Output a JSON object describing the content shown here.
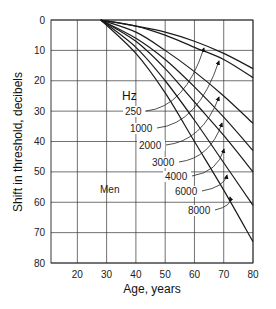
{
  "chart_data": {
    "type": "line",
    "title": "",
    "xlabel": "Age, years",
    "ylabel": "Shift in threshold, decibels",
    "xlim": [
      11,
      80
    ],
    "ylim": [
      0,
      80
    ],
    "y_inverted": true,
    "grid": true,
    "x_ticks": [
      20,
      30,
      40,
      50,
      60,
      70,
      80
    ],
    "y_ticks": [
      0,
      10,
      20,
      30,
      40,
      50,
      60,
      70,
      80
    ],
    "legend_title": "Hz",
    "annotation": "Men",
    "series": [
      {
        "name": "250",
        "x": [
          28,
          40,
          50,
          60,
          70,
          80
        ],
        "y": [
          0,
          2,
          4,
          7,
          11,
          16
        ]
      },
      {
        "name": "1000",
        "x": [
          28,
          40,
          50,
          60,
          70,
          80
        ],
        "y": [
          0,
          2,
          5,
          9,
          13,
          19
        ]
      },
      {
        "name": "2000",
        "x": [
          28,
          40,
          50,
          60,
          70,
          80
        ],
        "y": [
          0,
          4,
          10,
          17,
          25,
          34
        ]
      },
      {
        "name": "3000",
        "x": [
          28,
          40,
          50,
          60,
          70,
          80
        ],
        "y": [
          0,
          6,
          13,
          22,
          32,
          43
        ]
      },
      {
        "name": "4000",
        "x": [
          28,
          40,
          50,
          60,
          70,
          80
        ],
        "y": [
          0,
          7,
          16,
          27,
          38,
          50
        ]
      },
      {
        "name": "6000",
        "x": [
          28,
          40,
          50,
          60,
          70,
          80
        ],
        "y": [
          0,
          9,
          20,
          33,
          47,
          61
        ]
      },
      {
        "name": "8000",
        "x": [
          28,
          40,
          50,
          60,
          70,
          80
        ],
        "y": [
          0,
          11,
          24,
          40,
          56,
          73
        ]
      }
    ],
    "label_positions": [
      {
        "name": "250",
        "lx": 125,
        "ly": 115,
        "ax": 204,
        "ay": 48
      },
      {
        "name": "1000",
        "lx": 130,
        "ly": 132,
        "ax": 219,
        "ay": 61
      },
      {
        "name": "2000",
        "lx": 139,
        "ly": 149,
        "ax": 219,
        "ay": 97
      },
      {
        "name": "3000",
        "lx": 152,
        "ly": 166,
        "ax": 222,
        "ay": 123
      },
      {
        "name": "4000",
        "lx": 165,
        "ly": 180,
        "ax": 224,
        "ay": 149
      },
      {
        "name": "6000",
        "lx": 175,
        "ly": 195,
        "ax": 227,
        "ay": 175
      },
      {
        "name": "8000",
        "lx": 188,
        "ly": 214,
        "ax": 230,
        "ay": 197
      }
    ]
  }
}
